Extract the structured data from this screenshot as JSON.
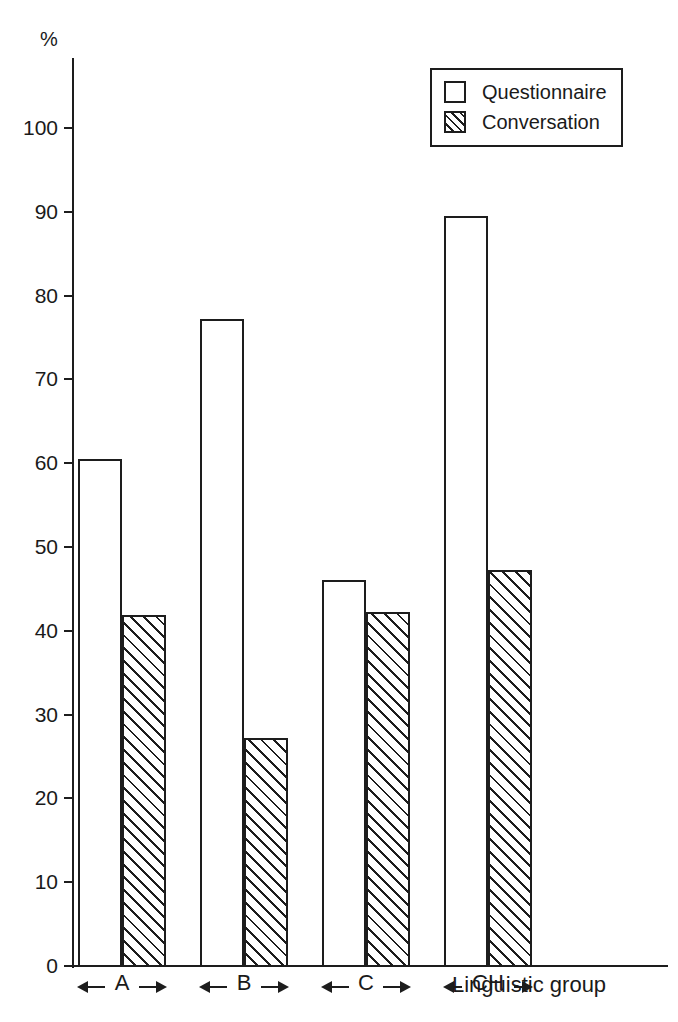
{
  "chart_data": {
    "type": "bar",
    "title": "",
    "subtitle": "",
    "xlabel": "Linguistic group",
    "ylabel": "%",
    "categories": [
      "A",
      "B",
      "C",
      "CH"
    ],
    "series": [
      {
        "name": "Questionnaire",
        "pattern": "empty",
        "values": [
          60.5,
          77.2,
          46.1,
          89.5
        ]
      },
      {
        "name": "Conversation",
        "pattern": "hatched",
        "values": [
          41.9,
          27.2,
          42.2,
          47.2
        ]
      }
    ],
    "ylim": [
      0,
      105
    ],
    "yticks": [
      0,
      10,
      20,
      30,
      40,
      50,
      60,
      70,
      80,
      90,
      100
    ],
    "ytick_labels": [
      "0",
      "10",
      "20",
      "30",
      "40",
      "50",
      "60",
      "70",
      "80",
      "90",
      "100"
    ],
    "grid": false,
    "legend_position": "top-right",
    "legend_entries": [
      "Questionnaire",
      "Conversation"
    ],
    "annotations": [
      "Each linguistic group is delimited on the x-axis by a double-headed span arrow."
    ]
  },
  "legend": {
    "items": [
      {
        "label": "Questionnaire",
        "swatch": "empty-square-icon"
      },
      {
        "label": "Conversation",
        "swatch": "hatched-square-icon"
      }
    ]
  },
  "axes": {
    "unit_label": "%",
    "x_title": "Linguistic group"
  },
  "colors": {
    "ink": "#1d1d1d",
    "paper": "#ffffff"
  }
}
